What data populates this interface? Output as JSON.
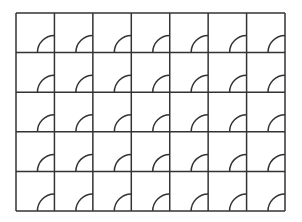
{
  "diagram": {
    "type": "tiling-grid",
    "rows": 5,
    "cols": 7,
    "origin": {
      "x": 16,
      "y": 13
    },
    "cell_width": 38.43,
    "cell_height": 39.6,
    "arc": {
      "shape": "quarter-circle",
      "anchor_corner": "bottom-right",
      "radius": 17,
      "from": "bottom-edge",
      "to": "right-edge"
    },
    "colors": {
      "background": "#ffffff",
      "line": "#333333"
    },
    "line_width": 1.5
  }
}
